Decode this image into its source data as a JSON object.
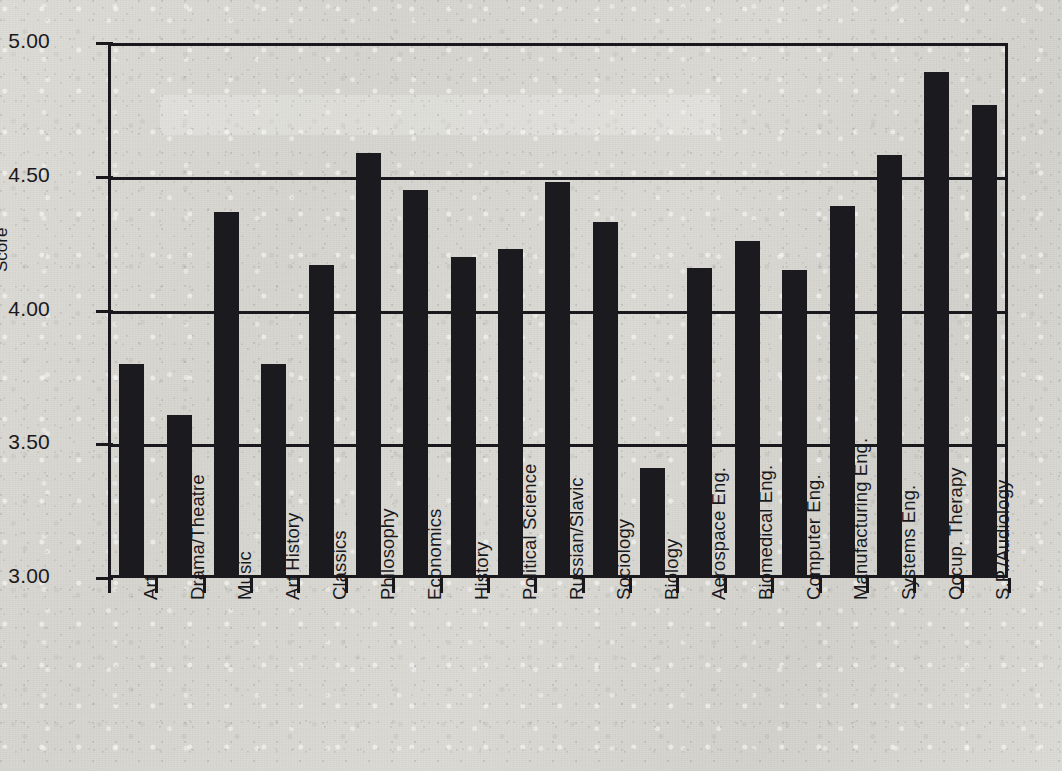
{
  "chart_data": {
    "type": "bar",
    "title": "",
    "xlabel": "",
    "ylabel": "Score",
    "ylim": [
      3.0,
      5.0
    ],
    "ytick_labels": [
      "5.00",
      "4.50",
      "4.00",
      "3.50",
      "3.00"
    ],
    "ytick_values": [
      5.0,
      4.5,
      4.0,
      3.5,
      3.0
    ],
    "grid": true,
    "legend": null,
    "bar_color": "#1b1b1f",
    "background_color": "#d8d7d2",
    "axis_color": "#16161a",
    "categories": [
      "Art",
      "Drama/Theatre",
      "Music",
      "Art History",
      "Classics",
      "Philosophy",
      "Economics",
      "History",
      "Political  Science",
      "Russian/Slavic",
      "Sociology",
      "Biology",
      "Aerospace Eng.",
      "Biomedical Eng.",
      "Computer Eng.",
      "Manufacturing Eng.",
      "Systems Eng.",
      "Occup. Therapy",
      "S.P./Audiology"
    ],
    "values": [
      3.8,
      3.61,
      4.37,
      3.8,
      4.17,
      4.59,
      4.45,
      4.2,
      4.23,
      4.48,
      4.33,
      3.41,
      4.16,
      4.26,
      4.15,
      4.39,
      4.58,
      4.89,
      4.77
    ]
  }
}
